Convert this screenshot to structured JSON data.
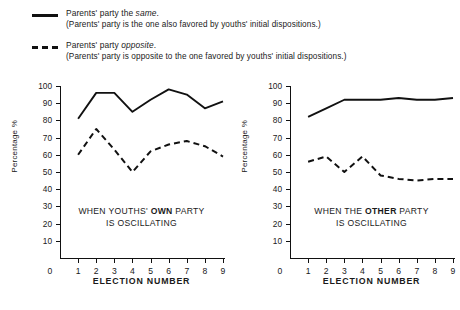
{
  "legend": [
    {
      "style": "solid",
      "title_pre": "Parents' party the ",
      "title_italic": "same",
      "title_post": ".",
      "sub": "(Parents' party is the one also favored by youths' initial dispositions.)"
    },
    {
      "style": "dashed",
      "title_pre": "Parents' party ",
      "title_italic": "opposite",
      "title_post": ".",
      "sub": "(Parents' party is opposite to the one favored by youths' initial dispositions.)"
    }
  ],
  "chart_data": [
    {
      "type": "line",
      "id": "left",
      "title": "",
      "annotation_line1_pre": "WHEN YOUTHS' ",
      "annotation_line1_bold": "OWN",
      "annotation_line1_post": " PARTY",
      "annotation_line2": "IS OSCILLATING",
      "xlabel": "ELECTION NUMBER",
      "ylabel": "Percentage %",
      "x": [
        1,
        2,
        3,
        4,
        5,
        6,
        7,
        8,
        9
      ],
      "xticklabels": [
        "0",
        "1",
        "2",
        "3",
        "4",
        "5",
        "6",
        "7",
        "8",
        "9"
      ],
      "yticklabels": [
        "100",
        "90",
        "80",
        "70",
        "60",
        "50",
        "40",
        "30",
        "20",
        "10"
      ],
      "xlim": [
        0,
        9
      ],
      "ylim": [
        0,
        100
      ],
      "grid": false,
      "legend_position": "above-figure",
      "series": [
        {
          "name": "Parents' party the same",
          "style": "solid",
          "values": [
            81,
            96,
            96,
            85,
            92,
            98,
            95,
            87,
            91
          ]
        },
        {
          "name": "Parents' party opposite",
          "style": "dashed",
          "values": [
            60,
            75,
            63,
            50,
            62,
            66,
            68,
            65,
            59
          ]
        }
      ]
    },
    {
      "type": "line",
      "id": "right",
      "title": "",
      "annotation_line1_pre": "WHEN THE ",
      "annotation_line1_bold": "OTHER",
      "annotation_line1_post": " PARTY",
      "annotation_line2": "IS OSCILLATING",
      "xlabel": "ELECTION NUMBER",
      "ylabel": "Percentage %",
      "x": [
        1,
        2,
        3,
        4,
        5,
        6,
        7,
        8,
        9
      ],
      "xticklabels": [
        "0",
        "1",
        "2",
        "3",
        "4",
        "5",
        "6",
        "7",
        "8",
        "9"
      ],
      "yticklabels": [
        "100",
        "90",
        "80",
        "70",
        "60",
        "50",
        "40",
        "30",
        "20",
        "10"
      ],
      "xlim": [
        0,
        9
      ],
      "ylim": [
        0,
        100
      ],
      "grid": false,
      "legend_position": "above-figure",
      "series": [
        {
          "name": "Parents' party the same",
          "style": "solid",
          "values": [
            82,
            87,
            92,
            92,
            92,
            93,
            92,
            92,
            93
          ]
        },
        {
          "name": "Parents' party opposite",
          "style": "dashed",
          "values": [
            56,
            59,
            50,
            59,
            48,
            46,
            45,
            46,
            46
          ]
        }
      ]
    }
  ]
}
